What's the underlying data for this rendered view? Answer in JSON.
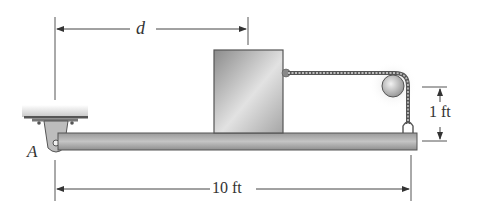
{
  "figure": {
    "type": "engineering statics diagram"
  },
  "labels": {
    "distance_d": "d",
    "beam_length": "10 ft",
    "height": "1 ft",
    "support_point": "A"
  },
  "dimensions": {
    "beam_length_ft": 10,
    "pulley_height_ft": 1,
    "block_position_symbol": "d"
  },
  "colors": {
    "line": "#444444",
    "beam_fill": "#a8a8a8",
    "beam_edge": "#555555",
    "block_fill": "#b8b8b8",
    "block_edge": "#555555",
    "rope": "#666666",
    "pulley": "#c8c8c8"
  }
}
